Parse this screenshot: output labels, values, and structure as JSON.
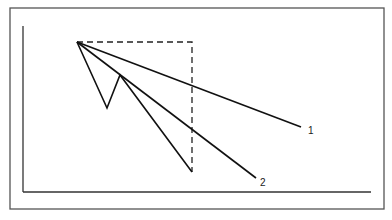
{
  "diagram": {
    "frame": {
      "x": 10,
      "y": 8,
      "width": 374,
      "height": 201,
      "stroke": "#555555"
    },
    "axes": {
      "origin": [
        23,
        192
      ],
      "y_top": [
        23,
        26
      ],
      "x_end": [
        371,
        192
      ],
      "stroke": "#333333"
    },
    "apex": [
      77,
      42
    ],
    "dashed_box": {
      "points": [
        [
          77,
          42
        ],
        [
          192,
          42
        ],
        [
          192,
          172
        ]
      ],
      "stroke": "#222222",
      "dash": "6,4"
    },
    "zigzag": {
      "points": [
        [
          77,
          42
        ],
        [
          107,
          108
        ],
        [
          120,
          75
        ],
        [
          192,
          172
        ]
      ],
      "stroke": "#111111"
    },
    "lines": [
      {
        "id": "1",
        "from": [
          77,
          42
        ],
        "to": [
          301,
          127
        ],
        "label": "1",
        "label_pos": [
          308,
          134
        ]
      },
      {
        "id": "2",
        "from": [
          77,
          42
        ],
        "to": [
          256,
          178
        ],
        "label": "2",
        "label_pos": [
          260,
          186
        ]
      }
    ]
  }
}
